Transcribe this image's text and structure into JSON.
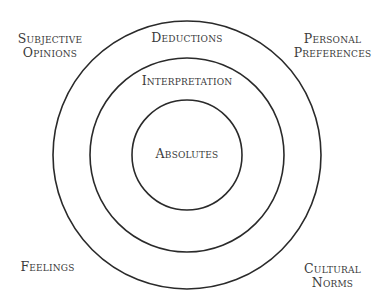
{
  "diagram": {
    "type": "concentric-circles",
    "center": {
      "x": 187,
      "y": 155
    },
    "stroke_color": "#2a2a2a",
    "background": "#ffffff",
    "text_color": "#3a3a3a",
    "rings": [
      {
        "name": "outer",
        "radius": 134,
        "label": "Deductions"
      },
      {
        "name": "middle",
        "radius": 97,
        "label": "Interpretation"
      },
      {
        "name": "inner",
        "radius": 55,
        "label": "Absolutes"
      }
    ],
    "corner_labels": {
      "top_left": "Subjective\nOpinions",
      "top_right": "Personal\nPreferences",
      "bottom_left": "Feelings",
      "bottom_right": "Cultural\nNorms"
    }
  }
}
